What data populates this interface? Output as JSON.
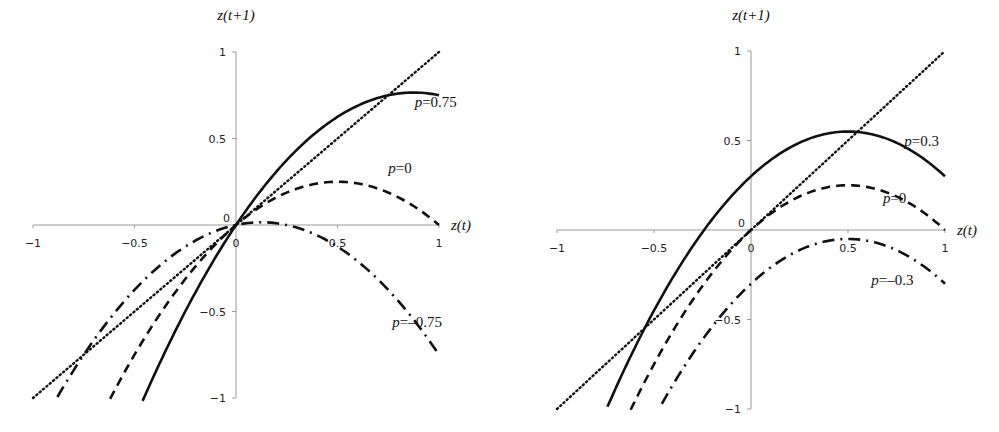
{
  "chart_data": [
    {
      "type": "line",
      "title": "",
      "xlabel": "z(t)",
      "ylabel": "z(t+1)",
      "xlim": [
        -1,
        1
      ],
      "ylim": [
        -1,
        1
      ],
      "xticks": [
        "-1",
        "-0.5",
        "0",
        "0.5",
        "1"
      ],
      "yticks": [
        "1",
        "0.5",
        "0",
        "-0.5",
        "-1"
      ],
      "grid": false,
      "legend": "inline labels",
      "formula": "z(t+1) = z(t) + p*z(t) - z(t)^2",
      "series": [
        {
          "name": "p=0.75",
          "style": "solid",
          "x": [
            -0.46,
            -0.25,
            0,
            0.25,
            0.5,
            0.75,
            0.875,
            1
          ],
          "y": [
            -1.0,
            -0.5,
            0,
            0.375,
            0.625,
            0.75,
            0.766,
            0.75
          ]
        },
        {
          "name": "p=0",
          "style": "dashed",
          "x": [
            -0.62,
            -0.5,
            -0.25,
            0,
            0.25,
            0.5,
            0.75,
            1
          ],
          "y": [
            -1.0,
            -0.75,
            -0.3125,
            0,
            0.1875,
            0.25,
            0.1875,
            0
          ]
        },
        {
          "name": "p=-0.75",
          "style": "dashdot",
          "x": [
            -0.88,
            -0.5,
            -0.25,
            0,
            0.125,
            0.25,
            0.5,
            0.75,
            1
          ],
          "y": [
            -0.99,
            -0.375,
            -0.125,
            0,
            0.016,
            0,
            -0.125,
            -0.375,
            -0.75
          ]
        },
        {
          "name": "45° line",
          "style": "dotted",
          "x": [
            -1,
            1
          ],
          "y": [
            -1,
            1
          ]
        }
      ],
      "annotations": [
        {
          "text": "p=0.75",
          "x": 0.88,
          "y": 0.68
        },
        {
          "text": "p=0",
          "x": 0.75,
          "y": 0.3
        },
        {
          "text": "p=-0.75",
          "x": 0.77,
          "y": -0.59
        }
      ]
    },
    {
      "type": "line",
      "title": "",
      "xlabel": "z(t)",
      "ylabel": "z(t+1)",
      "xlim": [
        -1,
        1
      ],
      "ylim": [
        -1,
        1
      ],
      "xticks": [
        "-1",
        "-0.5",
        "0",
        "0.5",
        "1"
      ],
      "yticks": [
        "1",
        "0.5",
        "0",
        "-0.5",
        "-1"
      ],
      "grid": false,
      "legend": "inline labels",
      "formula": "z(t+1) = p + z(t) - z(t)^2",
      "series": [
        {
          "name": "p=0.3",
          "style": "solid",
          "x": [
            -0.74,
            -0.5,
            -0.25,
            0,
            0.25,
            0.5,
            0.75,
            1
          ],
          "y": [
            -0.99,
            -0.45,
            -0.0125,
            0.3,
            0.4875,
            0.55,
            0.4875,
            0.3
          ]
        },
        {
          "name": "p=0",
          "style": "dashed",
          "x": [
            -0.62,
            -0.5,
            -0.25,
            0,
            0.25,
            0.5,
            0.75,
            1
          ],
          "y": [
            -1.0,
            -0.75,
            -0.3125,
            0,
            0.1875,
            0.25,
            0.1875,
            0
          ]
        },
        {
          "name": "p=-0.3",
          "style": "dashdot",
          "x": [
            -0.46,
            -0.25,
            0,
            0.25,
            0.5,
            0.75,
            1
          ],
          "y": [
            -0.97,
            -0.6125,
            -0.3,
            -0.1125,
            -0.05,
            -0.1125,
            -0.3
          ]
        },
        {
          "name": "45° line",
          "style": "dotted",
          "x": [
            -1,
            1
          ],
          "y": [
            -1,
            1
          ]
        }
      ],
      "annotations": [
        {
          "text": "p=0.3",
          "x": 0.79,
          "y": 0.47
        },
        {
          "text": "p=0",
          "x": 0.68,
          "y": 0.15
        },
        {
          "text": "p=-0.3",
          "x": 0.62,
          "y": -0.31
        }
      ]
    }
  ],
  "layout": [
    {
      "originX": 236,
      "originY": 225,
      "xScale": 203,
      "yScale": 173
    },
    {
      "originX": 751,
      "originY": 230,
      "xScale": 194,
      "yScale": 179
    }
  ]
}
